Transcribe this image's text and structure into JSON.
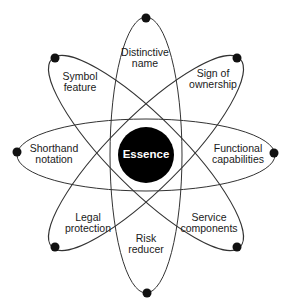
{
  "diagram": {
    "type": "atom-orbit-diagram",
    "center": {
      "label": "Essence",
      "fill": "#000000",
      "text_color": "#ffffff"
    },
    "orbit_color": "#333333",
    "dot_color": "#111111",
    "nodes": [
      {
        "id": "top",
        "line1": "Distinctive",
        "line2": "name"
      },
      {
        "id": "top-right",
        "line1": "Sign of",
        "line2": "ownership"
      },
      {
        "id": "right",
        "line1": "Functional",
        "line2": "capabilities"
      },
      {
        "id": "bottom-right",
        "line1": "Service",
        "line2": "components"
      },
      {
        "id": "bottom",
        "line1": "Risk",
        "line2": "reducer"
      },
      {
        "id": "bottom-left",
        "line1": "Legal",
        "line2": "protection"
      },
      {
        "id": "left",
        "line1": "Shorthand",
        "line2": "notation"
      },
      {
        "id": "top-left",
        "line1": "Symbol",
        "line2": "feature"
      }
    ]
  }
}
